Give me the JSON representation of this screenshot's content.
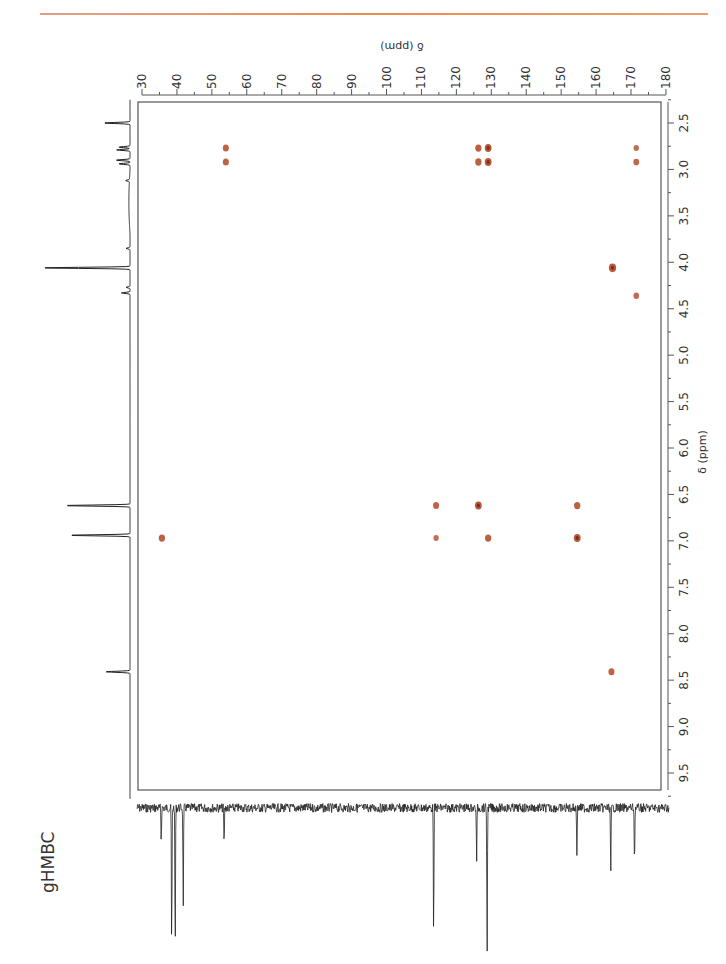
{
  "chart_data": {
    "type": "heatmap",
    "subtype": "2D NMR gHMBC contour plot",
    "title": "gHMBC",
    "xlabel": "δ (ppm)",
    "ylabel": "δ (ppm)",
    "x_axis": {
      "nucleus": "13C",
      "range": [
        30,
        180
      ],
      "ticks": [
        30,
        40,
        50,
        60,
        70,
        80,
        90,
        100,
        110,
        120,
        130,
        140,
        150,
        160,
        170,
        180
      ],
      "minor_step": 5,
      "position": "top",
      "labels_rotated": true
    },
    "y_axis": {
      "nucleus": "1H",
      "range": [
        2.25,
        9.8
      ],
      "ticks": [
        2.5,
        3.0,
        3.5,
        4.0,
        4.5,
        5.0,
        5.5,
        6.0,
        6.5,
        7.0,
        7.5,
        8.0,
        8.5,
        9.0,
        9.5
      ],
      "tick_labels": [
        "2.5",
        "3.0",
        "3.5",
        "4.0",
        "4.5",
        "5.0",
        "5.5",
        "6.0",
        "6.5",
        "7.0",
        "7.5",
        "8.0",
        "8.5",
        "9.0",
        "9.5"
      ],
      "position": "right",
      "labels_rotated": true
    },
    "grid": false,
    "cross_peaks": [
      {
        "c": 54.0,
        "h": 2.77,
        "intensity": 0.7
      },
      {
        "c": 54.0,
        "h": 2.92,
        "intensity": 0.7
      },
      {
        "c": 126.3,
        "h": 2.77,
        "intensity": 0.8
      },
      {
        "c": 129.1,
        "h": 2.77,
        "intensity": 1.0
      },
      {
        "c": 126.3,
        "h": 2.92,
        "intensity": 0.8
      },
      {
        "c": 129.1,
        "h": 2.92,
        "intensity": 1.0
      },
      {
        "c": 171.5,
        "h": 2.77,
        "intensity": 0.4
      },
      {
        "c": 171.5,
        "h": 2.92,
        "intensity": 0.6
      },
      {
        "c": 164.7,
        "h": 4.06,
        "intensity": 1.2
      },
      {
        "c": 171.5,
        "h": 4.36,
        "intensity": 0.5
      },
      {
        "c": 114.2,
        "h": 6.62,
        "intensity": 0.7
      },
      {
        "c": 126.3,
        "h": 6.62,
        "intensity": 1.0
      },
      {
        "c": 154.6,
        "h": 6.62,
        "intensity": 0.8
      },
      {
        "c": 35.7,
        "h": 6.97,
        "intensity": 0.8
      },
      {
        "c": 114.2,
        "h": 6.97,
        "intensity": 0.4
      },
      {
        "c": 129.1,
        "h": 6.97,
        "intensity": 0.8
      },
      {
        "c": 154.6,
        "h": 6.97,
        "intensity": 1.0
      },
      {
        "c": 164.4,
        "h": 8.41,
        "intensity": 0.7
      }
    ],
    "proton_projection": {
      "peaks": [
        {
          "h": 2.5,
          "height": 0.28
        },
        {
          "h": 2.76,
          "height": 0.12
        },
        {
          "h": 2.79,
          "height": 0.14
        },
        {
          "h": 2.9,
          "height": 0.15
        },
        {
          "h": 2.94,
          "height": 0.12
        },
        {
          "h": 3.12,
          "height": 0.04
        },
        {
          "h": 3.85,
          "height": 0.04
        },
        {
          "h": 4.06,
          "height": 0.95
        },
        {
          "h": 4.27,
          "height": 0.04
        },
        {
          "h": 4.33,
          "height": 0.09
        },
        {
          "h": 6.62,
          "height": 0.7
        },
        {
          "h": 6.94,
          "height": 0.65
        },
        {
          "h": 8.41,
          "height": 0.25
        }
      ]
    },
    "carbon_projection": {
      "peaks": [
        {
          "c": 35.5,
          "depth": 0.22
        },
        {
          "c": 38.5,
          "depth": 0.95
        },
        {
          "c": 39.5,
          "depth": 0.95
        },
        {
          "c": 41.8,
          "depth": 0.65
        },
        {
          "c": 53.5,
          "depth": 0.25
        },
        {
          "c": 113.5,
          "depth": 0.85
        },
        {
          "c": 125.8,
          "depth": 0.35
        },
        {
          "c": 128.8,
          "depth": 1.0
        },
        {
          "c": 154.5,
          "depth": 0.3
        },
        {
          "c": 164.2,
          "depth": 0.45
        },
        {
          "c": 171.0,
          "depth": 0.38
        }
      ]
    },
    "colors": {
      "cross_peak": "#b5502f",
      "frame": "#555555",
      "spectrum": "#222222",
      "header_rule": "#f08a4c"
    }
  },
  "label": "gHMBC"
}
